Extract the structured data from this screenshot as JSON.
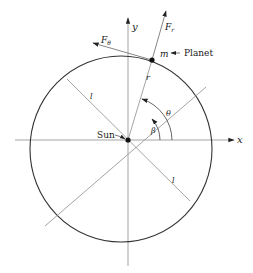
{
  "diagram": {
    "type": "orbit-geometry",
    "colors": {
      "ellipse": "#333333",
      "axes": "#999999",
      "lines": "#9a9a9a",
      "vectors": "#555555",
      "points": "#111111",
      "text": "#222222"
    },
    "labels": {
      "x_axis": "x",
      "y_axis": "y",
      "radial_force": "F",
      "radial_force_sub": "r",
      "tangential_force": "F",
      "tangential_force_sub": "θ",
      "mass": "m",
      "planet": "Planet",
      "sun": "Sun",
      "radius": "r",
      "angle_theta": "θ",
      "angle_beta": "β",
      "semi_latus_upper": "l",
      "semi_latus_lower": "l"
    }
  }
}
